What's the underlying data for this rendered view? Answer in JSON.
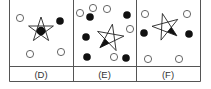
{
  "figure": {
    "stroke_color": "#555555",
    "fill_dark": "#111111",
    "panels": [
      {
        "label": "(D)",
        "x0": 9,
        "open_circles": [
          [
            20,
            18
          ],
          [
            30,
            54
          ],
          [
            61,
            52
          ]
        ],
        "filled_circles": [
          [
            60,
            21
          ]
        ],
        "star": {
          "cx": 41,
          "cy": 30,
          "r": 13,
          "rotation": 0,
          "filled_part": "center-dot",
          "dot": [
            41,
            31
          ]
        }
      },
      {
        "label": "(E)",
        "x0": 73,
        "open_circles": [
          [
            80,
            13
          ],
          [
            93,
            8
          ],
          [
            107,
            9
          ],
          [
            130,
            29
          ],
          [
            114,
            57
          ]
        ],
        "filled_circles": [
          [
            90,
            17
          ],
          [
            127,
            15
          ],
          [
            86,
            37
          ],
          [
            87,
            57
          ],
          [
            126,
            58
          ]
        ],
        "star": {
          "cx": 110,
          "cy": 38,
          "r": 14,
          "rotation": 10,
          "filled_part": "bottom-left-triangle"
        }
      },
      {
        "label": "(F)",
        "x0": 136,
        "open_circles": [
          [
            145,
            14
          ],
          [
            187,
            14
          ],
          [
            148,
            59
          ],
          [
            179,
            59
          ]
        ],
        "filled_circles": [
          [
            144,
            33
          ],
          [
            189,
            34
          ]
        ],
        "star": {
          "cx": 166,
          "cy": 27,
          "r": 14,
          "rotation": -15,
          "filled_part": "lower-right-triangle"
        }
      }
    ]
  }
}
